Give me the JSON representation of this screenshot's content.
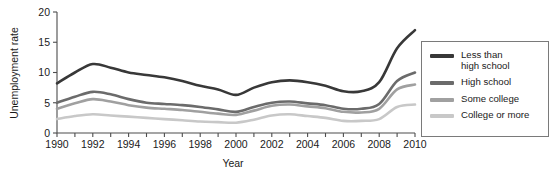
{
  "chart_data": {
    "type": "line",
    "title": "",
    "xlabel": "Year",
    "ylabel": "Unemployment rate",
    "xlim": [
      1990,
      2010
    ],
    "ylim": [
      0,
      20
    ],
    "yticks": [
      0,
      5,
      10,
      15,
      20
    ],
    "ytick_labels": [
      "0",
      "5",
      "10",
      "15",
      "20"
    ],
    "xticks": [
      1990,
      1991,
      1992,
      1993,
      1994,
      1995,
      1996,
      1997,
      1998,
      1999,
      2000,
      2001,
      2002,
      2003,
      2004,
      2005,
      2006,
      2007,
      2008,
      2009,
      2010
    ],
    "xtick_labels": [
      "1990",
      "",
      "1992",
      "",
      "1994",
      "",
      "1996",
      "",
      "1998",
      "",
      "2000",
      "",
      "2002",
      "",
      "2004",
      "",
      "2006",
      "",
      "2008",
      "",
      "2010"
    ],
    "grid": false,
    "legend_position": "right-outside",
    "x": [
      1990,
      1991,
      1992,
      1993,
      1994,
      1995,
      1996,
      1997,
      1998,
      1999,
      2000,
      2001,
      2002,
      2003,
      2004,
      2005,
      2006,
      2007,
      2008,
      2009,
      2010
    ],
    "series": [
      {
        "name": "Less than\nhigh school",
        "color": "#383838",
        "values": [
          8.2,
          10.0,
          11.4,
          10.8,
          10.0,
          9.6,
          9.2,
          8.6,
          7.8,
          7.2,
          6.3,
          7.5,
          8.4,
          8.7,
          8.4,
          7.8,
          6.9,
          6.9,
          8.4,
          14.0,
          17.0
        ]
      },
      {
        "name": "High school",
        "color": "#6b6b6b",
        "values": [
          5.0,
          6.0,
          6.8,
          6.4,
          5.6,
          5.0,
          4.8,
          4.6,
          4.3,
          3.9,
          3.5,
          4.3,
          5.0,
          5.2,
          4.9,
          4.6,
          4.0,
          4.0,
          4.8,
          8.6,
          10.0
        ]
      },
      {
        "name": "Some college",
        "color": "#a0a0a0",
        "values": [
          4.0,
          4.9,
          5.6,
          5.2,
          4.6,
          4.2,
          4.0,
          3.8,
          3.5,
          3.2,
          3.0,
          3.7,
          4.5,
          4.7,
          4.4,
          4.1,
          3.5,
          3.4,
          4.0,
          7.2,
          8.0
        ]
      },
      {
        "name": "College or more",
        "color": "#c8c8c8",
        "values": [
          2.3,
          2.8,
          3.1,
          2.9,
          2.7,
          2.5,
          2.3,
          2.1,
          1.9,
          1.8,
          1.7,
          2.2,
          2.9,
          3.1,
          2.8,
          2.5,
          2.0,
          2.0,
          2.3,
          4.3,
          4.7
        ]
      }
    ]
  },
  "legend": {
    "items": [
      {
        "label": "Less than\nhigh school",
        "color": "#383838"
      },
      {
        "label": "High school",
        "color": "#6b6b6b"
      },
      {
        "label": "Some college",
        "color": "#a0a0a0"
      },
      {
        "label": "College or more",
        "color": "#c8c8c8"
      }
    ]
  },
  "axes": {
    "y_title": "Unemployment rate",
    "x_title": "Year"
  }
}
